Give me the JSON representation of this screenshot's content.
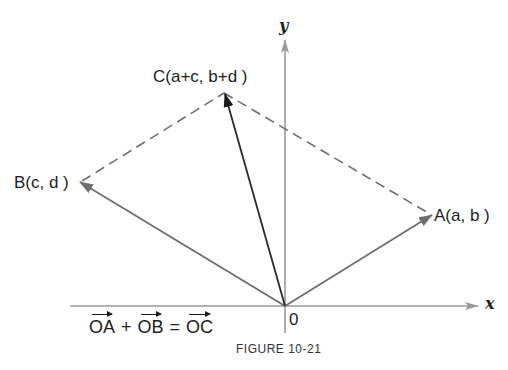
{
  "figure": {
    "caption": "FIGURE 10-21",
    "equation": {
      "vec1": "OA",
      "op1": "+",
      "vec2": "OB",
      "op2": "=",
      "vec3": "OC"
    }
  },
  "axes": {
    "x_label": "x",
    "y_label": "y",
    "origin_label": "0"
  },
  "points": {
    "A": {
      "label": "A(a, b )"
    },
    "B": {
      "label": "B(c, d )"
    },
    "C": {
      "label": "C(a+c, b+d )"
    }
  },
  "colors": {
    "axis": "#9a9a9a",
    "vector": "#6e6e6e",
    "resultant": "#2a2a2a",
    "dashed": "#6e6e6e",
    "text": "#1e1e1e"
  },
  "geometry": {
    "origin": [
      285,
      306
    ],
    "A": [
      432,
      215
    ],
    "B": [
      80,
      182
    ],
    "C": [
      224,
      93
    ],
    "x_axis": [
      70,
      478
    ],
    "y_axis": [
      40,
      333
    ]
  }
}
